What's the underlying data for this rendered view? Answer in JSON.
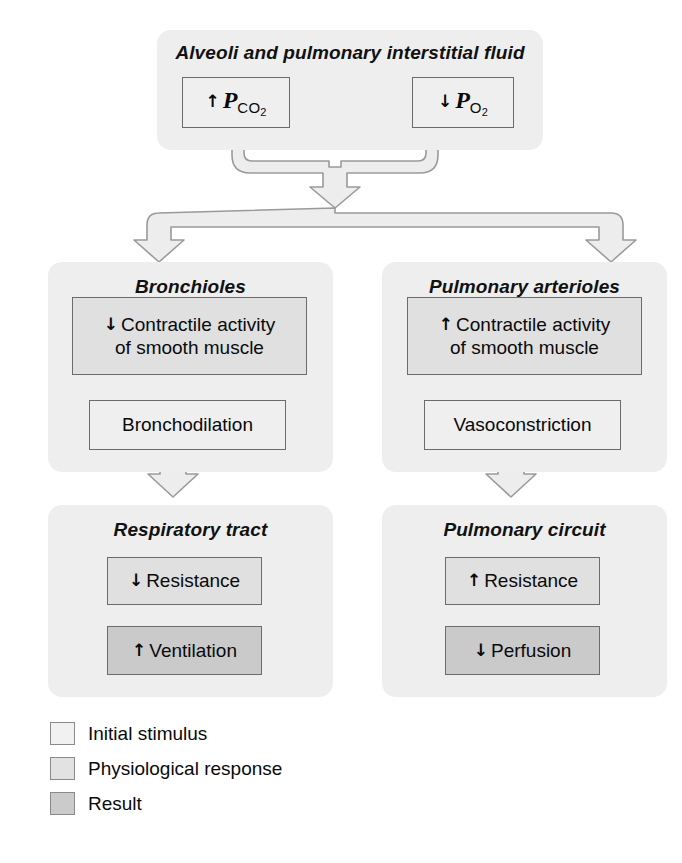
{
  "diagram": {
    "groups": [
      {
        "id": "alveoli",
        "title": "Alveoli and pulmonary interstitial fluid",
        "nodes": [
          {
            "id": "pco2",
            "arrow": "↑",
            "label": "P",
            "sub": "CO",
            "sub2": "2",
            "kind": "stimulus"
          },
          {
            "id": "po2",
            "arrow": "↓",
            "label": "P",
            "sub": "O",
            "sub2": "2",
            "kind": "stimulus"
          }
        ]
      },
      {
        "id": "bronchioles",
        "title": "Bronchioles",
        "nodes": [
          {
            "id": "bronch-contractile",
            "arrow": "↓",
            "line1": "Contractile activity",
            "line2": "of smooth muscle",
            "kind": "response"
          },
          {
            "id": "bronchodilation",
            "arrow": "",
            "line1": "Bronchodilation",
            "kind": "response-light"
          }
        ]
      },
      {
        "id": "arterioles",
        "title": "Pulmonary arterioles",
        "nodes": [
          {
            "id": "art-contractile",
            "arrow": "↑",
            "line1": "Contractile activity",
            "line2": "of smooth muscle",
            "kind": "response"
          },
          {
            "id": "vasoconstriction",
            "arrow": "",
            "line1": "Vasoconstriction",
            "kind": "response-light"
          }
        ]
      },
      {
        "id": "resp-tract",
        "title": "Respiratory tract",
        "nodes": [
          {
            "id": "resp-resistance",
            "arrow": "↓",
            "line1": "Resistance",
            "kind": "response"
          },
          {
            "id": "ventilation",
            "arrow": "↑",
            "line1": "Ventilation",
            "kind": "result"
          }
        ]
      },
      {
        "id": "pulm-circuit",
        "title": "Pulmonary circuit",
        "nodes": [
          {
            "id": "circ-resistance",
            "arrow": "↑",
            "line1": "Resistance",
            "kind": "response"
          },
          {
            "id": "perfusion",
            "arrow": "↓",
            "line1": "Perfusion",
            "kind": "result"
          }
        ]
      }
    ]
  },
  "legend": {
    "items": [
      {
        "label": "Initial stimulus",
        "color": "#f1f1f1"
      },
      {
        "label": "Physiological response",
        "color": "#e2e2e2"
      },
      {
        "label": "Result",
        "color": "#cbcbcb"
      }
    ]
  },
  "colors": {
    "panel_background": "#eeeeee",
    "stimulus_fill": "#efefef",
    "response_fill": "#e0e0e0",
    "result_fill": "#cacaca",
    "node_border": "#6b6b6b",
    "pipe_fill": "#ededed",
    "pipe_stroke": "#9a9a9a",
    "text": "#0a0a0a",
    "page_background": "#ffffff"
  }
}
